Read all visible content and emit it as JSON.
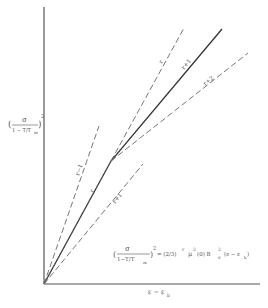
{
  "diagram": {
    "y_axis_label": {
      "num": "σ",
      "den": "1 − T/T",
      "den_sub": "m",
      "exp": "2"
    },
    "x_axis_label": {
      "main": "ε − ε",
      "sub": "b"
    },
    "equation": {
      "lhs_num": "σ",
      "lhs_den": "1−T/T",
      "lhs_den_sub": "m",
      "lhs_exp": "2",
      "rhs": "= (2/3)",
      "rhs_exp": "r",
      "mu": "μ",
      "mu_exp": "2",
      "mu_arg": "(0) B",
      "b_sub": "0",
      "b_exp": "2",
      "tail": "(ε − ε",
      "tail_sub": "b",
      "tail_close": ")"
    },
    "line_labels": {
      "r_upper": "r",
      "r_plus_1_upper": "r+1",
      "r_plus_2": "r+2",
      "r_minus_1": "r−1",
      "r_lower": "r",
      "r_plus_1_lower": "r+1"
    },
    "colors": {
      "axis": "#555555",
      "solid": "#333333",
      "dashed": "#666666"
    }
  }
}
